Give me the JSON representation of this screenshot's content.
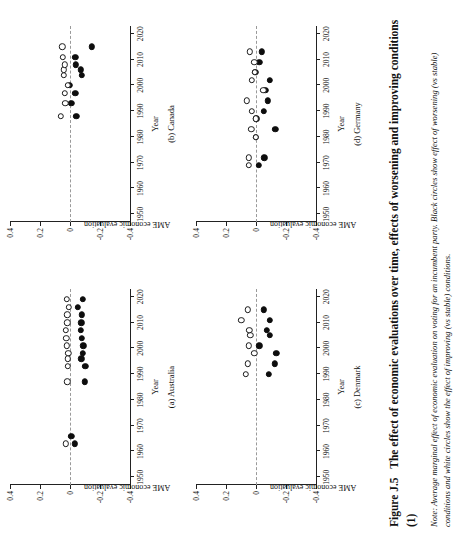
{
  "figure": {
    "number": "Figure J.5",
    "title": "The effect of economic evaluations over time, effects of worsening and improving conditions (1)",
    "note_label": "Note:",
    "note_text": "Average marginal effect of economic evaluation on voting for an incumbent party. Black circles show effect of worsening (vs stable) conditions and white circles show the effect of improving (vs stable) conditions."
  },
  "axes": {
    "xlabel": "Year",
    "ylabel": "AME economic evaluation",
    "xticks": [
      "1950",
      "1960",
      "1970",
      "1980",
      "1990",
      "2000",
      "2010",
      "2020"
    ],
    "xtick_values": [
      1950,
      1960,
      1970,
      1980,
      1990,
      2000,
      2010,
      2020
    ],
    "yticks": [
      "0.4",
      "0.2",
      "0",
      "-0.2",
      "-0.4"
    ],
    "ytick_values": [
      0.4,
      0.2,
      0,
      -0.2,
      -0.4
    ],
    "xlim": [
      1947,
      2023
    ],
    "ylim": [
      -0.4,
      0.4
    ],
    "zero_line": 0
  },
  "legend": {
    "black_circle": "worsening (vs stable) conditions",
    "white_circle": "improving (vs stable) conditions"
  },
  "chart_data": [
    {
      "type": "scatter",
      "panel": "(a) Australia",
      "title": "(a) Australia",
      "xlabel": "Year",
      "ylabel": "AME economic evaluation",
      "xlim": [
        1947,
        2023
      ],
      "ylim": [
        -0.4,
        0.4
      ],
      "grid": false,
      "series": [
        {
          "name": "worsening",
          "marker": "black-circle",
          "points": [
            {
              "x": 1963,
              "y": -0.03,
              "lo": -0.062,
              "hi": 0.001
            },
            {
              "x": 1966,
              "y": -0.008,
              "lo": -0.04,
              "hi": 0.02
            },
            {
              "x": 1987,
              "y": -0.098,
              "lo": -0.135,
              "hi": -0.06
            },
            {
              "x": 1993,
              "y": -0.103,
              "lo": -0.14,
              "hi": -0.066
            },
            {
              "x": 1996,
              "y": -0.075,
              "lo": -0.108,
              "hi": -0.042
            },
            {
              "x": 1998,
              "y": -0.084,
              "lo": -0.119,
              "hi": -0.049
            },
            {
              "x": 2001,
              "y": -0.089,
              "lo": -0.126,
              "hi": -0.053
            },
            {
              "x": 2004,
              "y": -0.078,
              "lo": -0.123,
              "hi": -0.035
            },
            {
              "x": 2007,
              "y": -0.072,
              "lo": -0.108,
              "hi": -0.037
            },
            {
              "x": 2010,
              "y": -0.076,
              "lo": -0.108,
              "hi": -0.045
            },
            {
              "x": 2013,
              "y": -0.079,
              "lo": -0.11,
              "hi": -0.048
            },
            {
              "x": 2016,
              "y": -0.052,
              "lo": -0.082,
              "hi": -0.022
            },
            {
              "x": 2019,
              "y": -0.085,
              "lo": -0.118,
              "hi": -0.053
            }
          ]
        },
        {
          "name": "improving",
          "marker": "white-circle",
          "points": [
            {
              "x": 1963,
              "y": 0.03,
              "lo": -0.005,
              "hi": 0.066
            },
            {
              "x": 1987,
              "y": 0.018,
              "lo": -0.016,
              "hi": 0.051
            },
            {
              "x": 1993,
              "y": 0.016,
              "lo": -0.018,
              "hi": 0.048
            },
            {
              "x": 1996,
              "y": 0.016,
              "lo": -0.014,
              "hi": 0.046
            },
            {
              "x": 1998,
              "y": 0.012,
              "lo": -0.02,
              "hi": 0.044
            },
            {
              "x": 2001,
              "y": 0.021,
              "lo": -0.014,
              "hi": 0.055
            },
            {
              "x": 2004,
              "y": 0.024,
              "lo": -0.012,
              "hi": 0.06
            },
            {
              "x": 2007,
              "y": 0.026,
              "lo": -0.008,
              "hi": 0.06
            },
            {
              "x": 2010,
              "y": 0.019,
              "lo": -0.013,
              "hi": 0.051
            },
            {
              "x": 2013,
              "y": 0.017,
              "lo": -0.014,
              "hi": 0.049
            },
            {
              "x": 2016,
              "y": 0.006,
              "lo": -0.022,
              "hi": 0.034
            },
            {
              "x": 2019,
              "y": 0.023,
              "lo": -0.01,
              "hi": 0.056
            }
          ]
        }
      ]
    },
    {
      "type": "scatter",
      "panel": "(b) Canada",
      "title": "(b) Canada",
      "xlabel": "Year",
      "ylabel": "AME economic evaluation",
      "xlim": [
        1947,
        2023
      ],
      "ylim": [
        -0.4,
        0.4
      ],
      "grid": false,
      "series": [
        {
          "name": "worsening",
          "marker": "black-circle",
          "points": [
            {
              "x": 1988,
              "y": -0.042,
              "lo": -0.098,
              "hi": 0.012
            },
            {
              "x": 1993,
              "y": -0.008,
              "lo": -0.07,
              "hi": 0.05
            },
            {
              "x": 1997,
              "y": -0.036,
              "lo": -0.093,
              "hi": 0.02
            },
            {
              "x": 2000,
              "y": 0.003,
              "lo": -0.07,
              "hi": 0.077
            },
            {
              "x": 2004,
              "y": -0.078,
              "lo": -0.135,
              "hi": -0.02
            },
            {
              "x": 2006,
              "y": -0.07,
              "lo": -0.12,
              "hi": -0.02
            },
            {
              "x": 2008,
              "y": -0.04,
              "lo": -0.09,
              "hi": 0.009
            },
            {
              "x": 2011,
              "y": -0.035,
              "lo": -0.09,
              "hi": 0.02
            },
            {
              "x": 2015,
              "y": -0.145,
              "lo": -0.182,
              "hi": -0.108
            }
          ]
        },
        {
          "name": "improving",
          "marker": "white-circle",
          "points": [
            {
              "x": 1988,
              "y": 0.06,
              "lo": 0.008,
              "hi": 0.112
            },
            {
              "x": 1993,
              "y": 0.032,
              "lo": -0.04,
              "hi": 0.103
            },
            {
              "x": 1997,
              "y": 0.036,
              "lo": -0.026,
              "hi": 0.097
            },
            {
              "x": 2000,
              "y": 0.015,
              "lo": -0.045,
              "hi": 0.076
            },
            {
              "x": 2004,
              "y": 0.04,
              "lo": -0.01,
              "hi": 0.09
            },
            {
              "x": 2006,
              "y": 0.042,
              "lo": -0.004,
              "hi": 0.088
            },
            {
              "x": 2008,
              "y": 0.034,
              "lo": -0.018,
              "hi": 0.086
            },
            {
              "x": 2011,
              "y": 0.046,
              "lo": -0.035,
              "hi": 0.128
            },
            {
              "x": 2015,
              "y": 0.052,
              "lo": 0.022,
              "hi": 0.082
            }
          ]
        }
      ]
    },
    {
      "type": "scatter",
      "panel": "(c) Denmark",
      "title": "(c) Denmark",
      "xlabel": "Year",
      "ylabel": "AME economic evaluation",
      "xlim": [
        1947,
        2023
      ],
      "ylim": [
        -0.4,
        0.4
      ],
      "grid": false,
      "series": [
        {
          "name": "worsening",
          "marker": "black-circle",
          "points": [
            {
              "x": 1990,
              "y": -0.085,
              "lo": -0.168,
              "hi": -0.002
            },
            {
              "x": 1994,
              "y": -0.124,
              "lo": -0.18,
              "hi": -0.068
            },
            {
              "x": 1998,
              "y": -0.135,
              "lo": -0.18,
              "hi": -0.09
            },
            {
              "x": 2001,
              "y": -0.022,
              "lo": -0.09,
              "hi": 0.046
            },
            {
              "x": 2005,
              "y": -0.092,
              "lo": -0.155,
              "hi": -0.03
            },
            {
              "x": 2007,
              "y": -0.074,
              "lo": -0.13,
              "hi": -0.018
            },
            {
              "x": 2011,
              "y": -0.092,
              "lo": -0.155,
              "hi": -0.03
            },
            {
              "x": 2015,
              "y": -0.052,
              "lo": -0.12,
              "hi": 0.016
            }
          ]
        },
        {
          "name": "improving",
          "marker": "white-circle",
          "points": [
            {
              "x": 1990,
              "y": 0.068,
              "lo": -0.028,
              "hi": 0.165
            },
            {
              "x": 1994,
              "y": 0.055,
              "lo": -0.015,
              "hi": 0.124
            },
            {
              "x": 1998,
              "y": 0.012,
              "lo": -0.04,
              "hi": 0.064
            },
            {
              "x": 2001,
              "y": 0.048,
              "lo": -0.03,
              "hi": 0.126
            },
            {
              "x": 2005,
              "y": 0.038,
              "lo": -0.01,
              "hi": 0.086
            },
            {
              "x": 2007,
              "y": 0.044,
              "lo": -0.006,
              "hi": 0.094
            },
            {
              "x": 2011,
              "y": 0.098,
              "lo": 0.012,
              "hi": 0.184
            },
            {
              "x": 2015,
              "y": 0.056,
              "lo": -0.008,
              "hi": 0.12
            }
          ]
        }
      ]
    },
    {
      "type": "scatter",
      "panel": "(d) Germany",
      "title": "(d) Germany",
      "xlabel": "Year",
      "ylabel": "AME economic evaluation",
      "xlim": [
        1947,
        2023
      ],
      "ylim": [
        -0.4,
        0.4
      ],
      "grid": false,
      "series": [
        {
          "name": "worsening",
          "marker": "black-circle",
          "points": [
            {
              "x": 1969,
              "y": -0.018,
              "lo": -0.072,
              "hi": 0.036
            },
            {
              "x": 1972,
              "y": -0.055,
              "lo": -0.108,
              "hi": -0.002
            },
            {
              "x": 1980,
              "y": 0.003,
              "lo": -0.056,
              "hi": 0.06
            },
            {
              "x": 1983,
              "y": -0.128,
              "lo": -0.196,
              "hi": -0.06
            },
            {
              "x": 1987,
              "y": -0.002,
              "lo": -0.108,
              "hi": 0.104
            },
            {
              "x": 1990,
              "y": -0.052,
              "lo": -0.108,
              "hi": 0.004
            },
            {
              "x": 1994,
              "y": -0.08,
              "lo": -0.138,
              "hi": -0.022
            },
            {
              "x": 1998,
              "y": -0.063,
              "lo": -0.09,
              "hi": -0.036
            },
            {
              "x": 2002,
              "y": -0.092,
              "lo": -0.132,
              "hi": -0.052
            },
            {
              "x": 2005,
              "y": 0.004,
              "lo": -0.085,
              "hi": 0.092
            },
            {
              "x": 2009,
              "y": -0.022,
              "lo": -0.064,
              "hi": 0.02
            },
            {
              "x": 2013,
              "y": -0.04,
              "lo": -0.1,
              "hi": 0.02
            }
          ]
        },
        {
          "name": "improving",
          "marker": "white-circle",
          "points": [
            {
              "x": 1969,
              "y": 0.046,
              "lo": -0.004,
              "hi": 0.096
            },
            {
              "x": 1972,
              "y": 0.048,
              "lo": -0.004,
              "hi": 0.1
            },
            {
              "x": 1980,
              "y": 0.002,
              "lo": -0.058,
              "hi": 0.062
            },
            {
              "x": 1983,
              "y": 0.032,
              "lo": -0.016,
              "hi": 0.08
            },
            {
              "x": 1987,
              "y": 0.0,
              "lo": -0.1,
              "hi": 0.1
            },
            {
              "x": 1990,
              "y": 0.03,
              "lo": -0.026,
              "hi": 0.086
            },
            {
              "x": 1994,
              "y": 0.062,
              "lo": 0.0,
              "hi": 0.124
            },
            {
              "x": 1998,
              "y": -0.048,
              "lo": -0.086,
              "hi": -0.01
            },
            {
              "x": 2002,
              "y": 0.03,
              "lo": -0.01,
              "hi": 0.07
            },
            {
              "x": 2005,
              "y": 0.006,
              "lo": -0.09,
              "hi": 0.102
            },
            {
              "x": 2009,
              "y": 0.012,
              "lo": -0.03,
              "hi": 0.054
            },
            {
              "x": 2013,
              "y": 0.042,
              "lo": -0.01,
              "hi": 0.094
            }
          ]
        }
      ]
    }
  ]
}
